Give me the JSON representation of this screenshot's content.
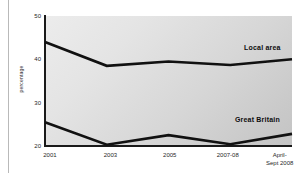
{
  "chart_data": {
    "type": "line",
    "title": "",
    "xlabel": "",
    "ylabel": "percentage",
    "categories": [
      "2001",
      "2003",
      "2005",
      "2007-08",
      "April-\nSept 2008"
    ],
    "ylim": [
      20,
      50
    ],
    "yticks": [
      "20",
      "30",
      "40",
      "50"
    ],
    "ytick_values": [
      20,
      30,
      40,
      50
    ],
    "grid": false,
    "legend_position": "inline-right",
    "series": [
      {
        "name": "Local area",
        "values": [
          44.0,
          38.5,
          39.5,
          38.7,
          40.0
        ],
        "color": "#111111"
      },
      {
        "name": "Great Britain",
        "values": [
          25.5,
          20.3,
          22.5,
          20.4,
          22.8
        ],
        "color": "#111111"
      }
    ]
  },
  "axis": {
    "y_title": "percentage"
  },
  "xticks": [
    {
      "line1": "2001",
      "line2": ""
    },
    {
      "line1": "2003",
      "line2": ""
    },
    {
      "line1": "2005",
      "line2": ""
    },
    {
      "line1": "2007-08",
      "line2": ""
    },
    {
      "line1": "April-",
      "line2": "Sept 2008"
    }
  ],
  "yticks": [
    {
      "label": "50"
    },
    {
      "label": "40"
    },
    {
      "label": "30"
    },
    {
      "label": "20"
    }
  ],
  "series_labels": [
    {
      "text": "Local area"
    },
    {
      "text": "Great Britain"
    }
  ],
  "colors": {
    "line": "#111111",
    "plot_bg_light": "#ececec",
    "plot_bg_dark": "#c4c4c4",
    "axis": "#1a1a1a",
    "text": "#1f1f1f"
  }
}
